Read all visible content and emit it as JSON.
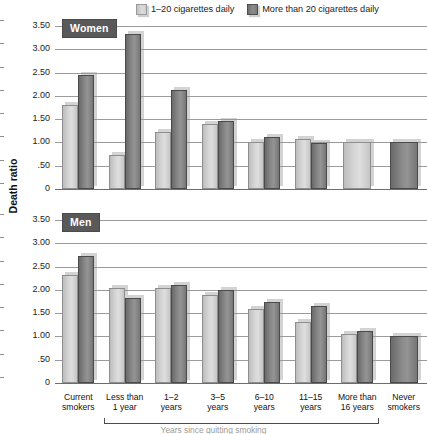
{
  "chart_data": {
    "type": "bar",
    "title": "",
    "xlabel": "",
    "ylabel": "Death ratio",
    "ylim": [
      0,
      3.5
    ],
    "grid": true,
    "legend_position": "top",
    "ytick_labels": [
      "3.50",
      "3.00",
      "2.50",
      "2.00",
      "1.50",
      "1.00",
      ".50",
      "0"
    ],
    "ytick_values": [
      3.5,
      3.0,
      2.5,
      2.0,
      1.5,
      1.0,
      0.5,
      0
    ],
    "categories": [
      "Current smokers",
      "Less than 1 year",
      "1–2 years",
      "3–5 years",
      "6–10 years",
      "11–15 years",
      "More than 16 years",
      "Never smokers"
    ],
    "legend": [
      "1–20 cigarettes daily",
      "More than 20 cigarettes daily"
    ],
    "panels": [
      {
        "label": "Women",
        "series": [
          {
            "name": "1–20 cigarettes daily",
            "values": [
              1.8,
              0.72,
              1.22,
              1.4,
              1.0,
              1.08,
              1.0,
              null
            ]
          },
          {
            "name": "More than 20 cigarettes daily",
            "values": [
              2.45,
              3.32,
              2.12,
              1.45,
              1.12,
              0.98,
              null,
              1.0
            ]
          }
        ]
      },
      {
        "label": "Men",
        "series": [
          {
            "name": "1–20 cigarettes daily",
            "values": [
              2.32,
              2.05,
              2.05,
              1.88,
              1.6,
              1.3,
              1.05,
              null
            ]
          },
          {
            "name": "More than 20 cigarettes daily",
            "values": [
              2.72,
              1.82,
              2.1,
              2.0,
              1.75,
              1.65,
              1.12,
              1.0
            ]
          }
        ]
      }
    ]
  },
  "legend": {
    "items": [
      {
        "label": "1–20 cigarettes daily",
        "style": "light"
      },
      {
        "label": "More than 20 cigarettes daily",
        "style": "dark"
      }
    ]
  },
  "axis": {
    "y_title": "Death ratio",
    "y_ticks": [
      "3.50",
      "3.00",
      "2.50",
      "2.00",
      "1.50",
      "1.00",
      ".50",
      "0"
    ]
  },
  "panels": [
    {
      "badge": "Women"
    },
    {
      "badge": "Men"
    }
  ],
  "x_axis": {
    "labels": [
      {
        "line1": "Current",
        "line2": "smokers"
      },
      {
        "line1": "Less than",
        "line2": "1 year"
      },
      {
        "line1": "1–2",
        "line2": "years"
      },
      {
        "line1": "3–5",
        "line2": "years"
      },
      {
        "line1": "6–10",
        "line2": "years"
      },
      {
        "line1": "11–15",
        "line2": "years"
      },
      {
        "line1": "More than",
        "line2": "16 years"
      },
      {
        "line1": "Never",
        "line2": "smokers"
      }
    ]
  },
  "footer": {
    "caption": "Years since quitting smoking"
  },
  "colors": {
    "bar_light": "#d6d6d6",
    "bar_dark": "#8a8a8a",
    "badge_bg": "#595959",
    "gridline": "#9b9b9b"
  }
}
